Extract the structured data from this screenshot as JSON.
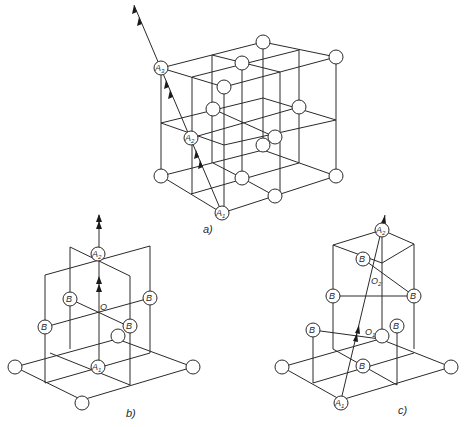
{
  "figure": {
    "type": "crystal-lattice-diagrams",
    "panels": [
      {
        "id": "a",
        "caption": "a)",
        "atoms": {
          "A1": "A",
          "A1_sub": "1",
          "A2": "A",
          "A2_sub": "2",
          "A3": "A",
          "A3_sub": "3"
        },
        "description": "Cubic lattice with translation vector through A1, A2, A3"
      },
      {
        "id": "b",
        "caption": "b)",
        "atoms": {
          "A1": "A",
          "A1_sub": "1",
          "A2": "A",
          "A2_sub": "2",
          "B": "B",
          "O": "O"
        },
        "description": "Screw/rotation axis through A1, O, A2 with B atoms"
      },
      {
        "id": "c",
        "caption": "c)",
        "atoms": {
          "A1": "A",
          "A1_sub": "1",
          "A2": "A",
          "A2_sub": "2",
          "B": "B",
          "O1": "O",
          "O1_sub": "1",
          "O2": "O",
          "O2_sub": "2"
        },
        "description": "Inclined axis through A1, O1, O2, A2 with B atoms"
      }
    ]
  },
  "colors": {
    "line": "#2a2a2a",
    "background": "#ffffff"
  }
}
